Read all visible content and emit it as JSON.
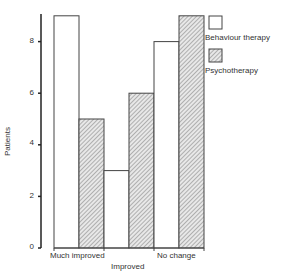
{
  "chart_data": {
    "type": "bar",
    "title": "",
    "xlabel": "",
    "ylabel": "Patients",
    "ylim": [
      0,
      9
    ],
    "yticks": [
      0,
      2,
      4,
      6,
      8
    ],
    "grid": false,
    "legend_position": "right-top",
    "categories": [
      "Much improved",
      "Improved",
      "No change"
    ],
    "series": [
      {
        "name": "Behaviour therapy",
        "fill": "white",
        "values": [
          9,
          3,
          8
        ]
      },
      {
        "name": "Psychotherapy",
        "fill": "hatched",
        "values": [
          5,
          6,
          9
        ]
      }
    ]
  },
  "axis": {
    "ylabel": "Patients",
    "ticks": [
      "0",
      "2",
      "4",
      "6",
      "8"
    ]
  },
  "categories": {
    "c0": "Much improved",
    "c1": "Improved",
    "c2": "No change"
  },
  "legend": {
    "s0": "Behaviour therapy",
    "s1": "Psychotherapy"
  }
}
